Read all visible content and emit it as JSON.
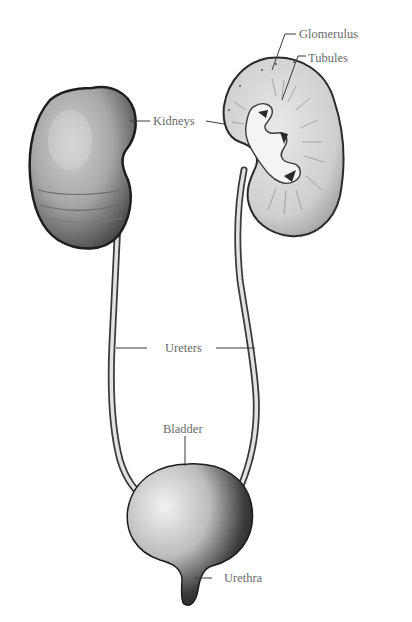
{
  "diagram": {
    "labels": {
      "glomerulus": "Glomerulus",
      "tubules": "Tubules",
      "kidneys": "Kidneys",
      "ureters": "Ureters",
      "bladder": "Bladder",
      "urethra": "Urethra"
    },
    "colors": {
      "background": "#ffffff",
      "organ_fill_light": "#d8d8d8",
      "organ_fill_mid": "#a8a8a8",
      "organ_outline": "#2a2a2a",
      "leader_line": "#3a3a3a",
      "label_text": "#6a6a6a"
    }
  }
}
